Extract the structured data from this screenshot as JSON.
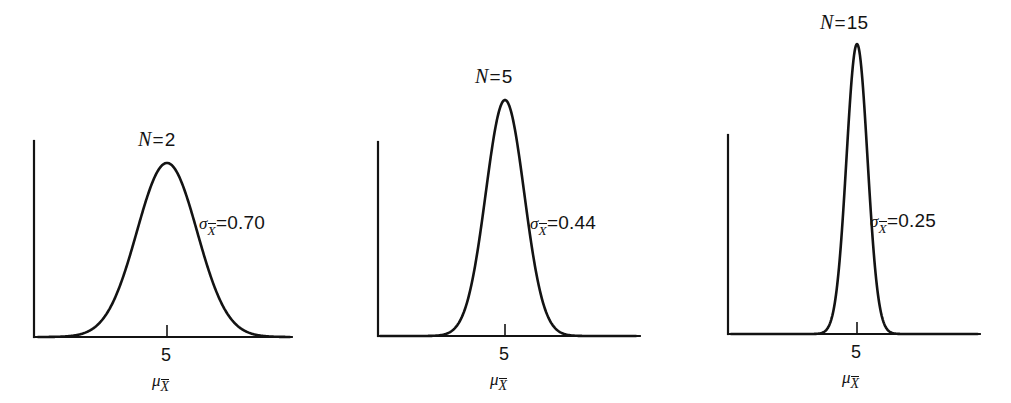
{
  "figure": {
    "background_color": "#ffffff",
    "line_color": "#131313",
    "axis_color": "#131313"
  },
  "chart_data": {
    "type": "line",
    "title": "",
    "xlabel": "",
    "ylabel": "",
    "grid": false,
    "legend": "none",
    "panels": [
      {
        "id": "panel-0",
        "n_label": {
          "symbol": "N",
          "eq": "=",
          "value": "2"
        },
        "sigma_label": {
          "symbol": "σ",
          "subscript": "X",
          "subscript_bar": true,
          "eq": "=",
          "value": "0.70"
        },
        "tick_label": "5",
        "mu_label": {
          "symbol": "μ",
          "subscript": "X",
          "subscript_bar": true
        },
        "mean": 5,
        "sigma": 0.7,
        "n": 2,
        "x_range": [
          2.0,
          8.0
        ],
        "peak_height_px": 174,
        "axis": {
          "x0": 34,
          "x1": 292,
          "y_baseline": 337,
          "y_top": 141,
          "tick_x": 167
        }
      },
      {
        "id": "panel-1",
        "n_label": {
          "symbol": "N",
          "eq": "=",
          "value": "5"
        },
        "sigma_label": {
          "symbol": "σ",
          "subscript": "X",
          "subscript_bar": true,
          "eq": "=",
          "value": "0.44"
        },
        "tick_label": "5",
        "mu_label": {
          "symbol": "μ",
          "subscript": "X",
          "subscript_bar": true
        },
        "mean": 5,
        "sigma": 0.44,
        "n": 5,
        "x_range": [
          2.0,
          8.0
        ],
        "peak_height_px": 236,
        "axis": {
          "x0": 378,
          "x1": 640,
          "y_baseline": 336,
          "y_top": 142,
          "tick_x": 505
        }
      },
      {
        "id": "panel-2",
        "n_label": {
          "symbol": "N",
          "eq": "=",
          "value": "15"
        },
        "sigma_label": {
          "symbol": "σ",
          "subscript": "X",
          "subscript_bar": true,
          "eq": "=",
          "value": "0.25"
        },
        "tick_label": "5",
        "mu_label": {
          "symbol": "μ",
          "subscript": "X",
          "subscript_bar": true
        },
        "mean": 5,
        "sigma": 0.25,
        "n": 15,
        "x_range": [
          2.0,
          8.0
        ],
        "peak_height_px": 290,
        "axis": {
          "x0": 728,
          "x1": 980,
          "y_baseline": 334,
          "y_top": 135,
          "tick_x": 857
        }
      }
    ]
  }
}
